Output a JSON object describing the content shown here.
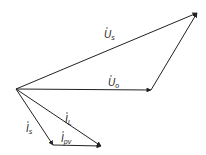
{
  "diagram": {
    "type": "phasor-diagram",
    "origin": [
      16,
      89
    ],
    "stroke_color": "#222222",
    "background": "#ffffff",
    "vectors": [
      {
        "id": "Us",
        "symbol": "U",
        "subscript": "s",
        "dot": true,
        "from": [
          16,
          89
        ],
        "to": [
          197,
          13
        ],
        "label_pos": [
          104,
          38
        ]
      },
      {
        "id": "Uo",
        "symbol": "U",
        "subscript": "o",
        "dot": true,
        "from": [
          16,
          89
        ],
        "to": [
          151,
          90
        ],
        "label_pos": [
          108,
          86
        ]
      },
      {
        "id": "Uo_to_Us",
        "symbol": "",
        "subscript": "",
        "dot": false,
        "from": [
          151,
          90
        ],
        "to": [
          197,
          13
        ],
        "label_pos": null
      },
      {
        "id": "IL",
        "symbol": "I",
        "subscript": "L",
        "dot": true,
        "from": [
          16,
          89
        ],
        "to": [
          101,
          146
        ],
        "label_pos": [
          64,
          123
        ]
      },
      {
        "id": "Is",
        "symbol": "I",
        "subscript": "s",
        "dot": true,
        "from": [
          16,
          89
        ],
        "to": [
          53,
          145
        ],
        "label_pos": [
          26,
          132
        ]
      },
      {
        "id": "Ipv",
        "symbol": "I",
        "subscript": "pv",
        "dot": true,
        "from": [
          53,
          145
        ],
        "to": [
          101,
          146
        ],
        "label_pos": [
          62,
          143
        ]
      }
    ],
    "labels": {
      "Us": {
        "main": "U",
        "sub": "s"
      },
      "Uo": {
        "main": "U",
        "sub": "o"
      },
      "IL": {
        "main": "I",
        "sub": "L"
      },
      "Is": {
        "main": "I",
        "sub": "s"
      },
      "Ipv": {
        "main": "I",
        "sub": "pv"
      }
    }
  }
}
